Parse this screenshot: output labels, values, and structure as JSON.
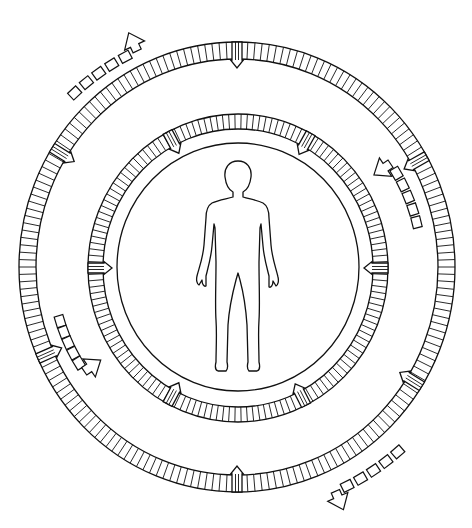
{
  "diagram": {
    "colors": {
      "line": "#111111",
      "background": "#ffffff"
    },
    "center": {
      "x": 237,
      "y": 267
    },
    "core_circle": {
      "rx": 121,
      "ry": 124,
      "cx": 238,
      "cy": 267
    },
    "rings": [
      {
        "name": "inner-ring",
        "cx": 238,
        "cy": 268,
        "rx_outer": 150,
        "ry_outer": 154,
        "band": 15,
        "segments": 150,
        "markers_deg": [
          -118,
          -61,
          0,
          63,
          118,
          180
        ]
      },
      {
        "name": "outer-ring",
        "cx": 237,
        "cy": 267,
        "rx_outer": 218,
        "ry_outer": 225,
        "band": 17,
        "segments": 190,
        "markers_deg": [
          -148,
          -90,
          -29.5,
          32,
          90,
          156
        ]
      }
    ],
    "flow_arrows": [
      {
        "name": "flow-arrow-top-left",
        "direction": "clockwise",
        "orbit": "outside",
        "start_deg": -133,
        "end_deg": -112,
        "r": 238
      },
      {
        "name": "flow-arrow-right",
        "direction": "counter-clockwise",
        "orbit": "between",
        "start_deg": -14,
        "end_deg": -37,
        "r": 185
      },
      {
        "name": "flow-arrow-left",
        "direction": "counter-clockwise",
        "orbit": "between",
        "start_deg": 163,
        "end_deg": 143,
        "r": 185
      },
      {
        "name": "flow-arrow-bottom-right",
        "direction": "clockwise",
        "orbit": "outside",
        "start_deg": 49,
        "end_deg": 69,
        "r": 245
      }
    ],
    "figure": {
      "name": "human-figure",
      "label": ""
    }
  }
}
